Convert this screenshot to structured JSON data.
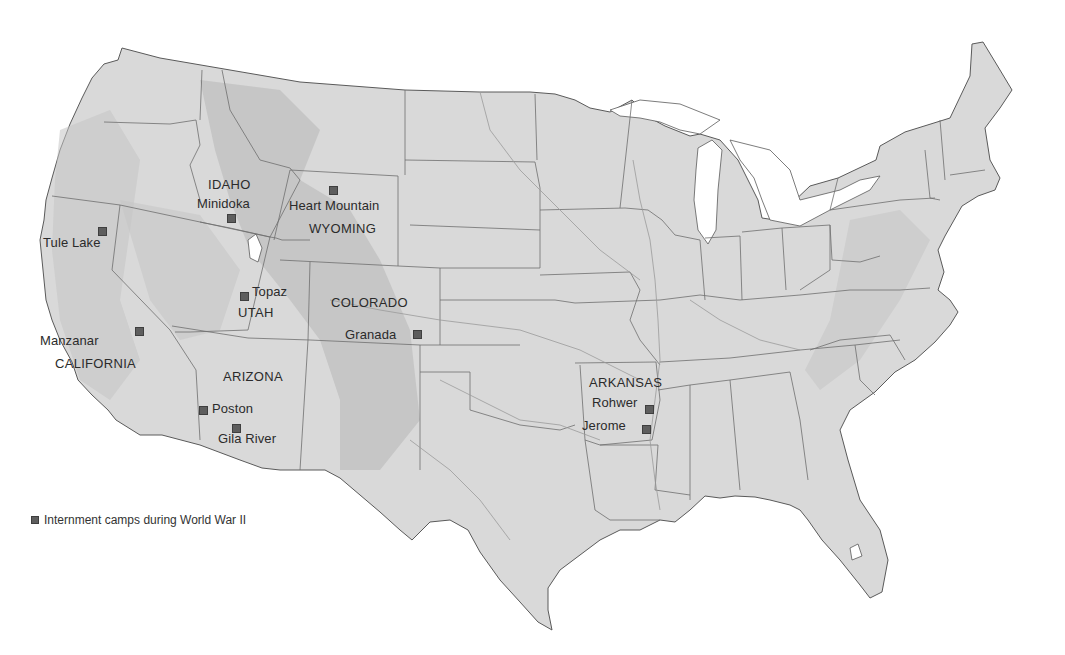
{
  "map": {
    "subject": "Japanese American internment camps, contiguous United States",
    "colors": {
      "land": "#d9d9d9",
      "relief": "#c4c4c4",
      "border": "#5a5a5a",
      "water": "#ffffff",
      "marker": "#5e5e5e",
      "text": "#2b2b2b"
    }
  },
  "states": [
    {
      "name": "IDAHO",
      "x": 208,
      "y": 178
    },
    {
      "name": "WYOMING",
      "x": 309,
      "y": 222
    },
    {
      "name": "UTAH",
      "x": 238,
      "y": 306
    },
    {
      "name": "COLORADO",
      "x": 331,
      "y": 296
    },
    {
      "name": "CALIFORNIA",
      "x": 55,
      "y": 357
    },
    {
      "name": "ARIZONA",
      "x": 223,
      "y": 370
    },
    {
      "name": "ARKANSAS",
      "x": 589,
      "y": 376
    }
  ],
  "camps": [
    {
      "name": "Tule Lake",
      "label_x": 43,
      "label_y": 236,
      "marker_x": 98,
      "marker_y": 227
    },
    {
      "name": "Minidoka",
      "label_x": 197,
      "label_y": 197,
      "marker_x": 227,
      "marker_y": 214
    },
    {
      "name": "Heart Mountain",
      "label_x": 289,
      "label_y": 199,
      "marker_x": 329,
      "marker_y": 186
    },
    {
      "name": "Topaz",
      "label_x": 252,
      "label_y": 285,
      "marker_x": 240,
      "marker_y": 292
    },
    {
      "name": "Granada",
      "label_x": 345,
      "label_y": 328,
      "marker_x": 413,
      "marker_y": 330
    },
    {
      "name": "Manzanar",
      "label_x": 40,
      "label_y": 334,
      "marker_x": 135,
      "marker_y": 327
    },
    {
      "name": "Poston",
      "label_x": 212,
      "label_y": 402,
      "marker_x": 199,
      "marker_y": 406
    },
    {
      "name": "Gila River",
      "label_x": 218,
      "label_y": 432,
      "marker_x": 232,
      "marker_y": 424
    },
    {
      "name": "Rohwer",
      "label_x": 592,
      "label_y": 396,
      "marker_x": 645,
      "marker_y": 405
    },
    {
      "name": "Jerome",
      "label_x": 582,
      "label_y": 419,
      "marker_x": 642,
      "marker_y": 425
    }
  ],
  "legend": {
    "label": "Internment camps during World War II",
    "icon": "square-marker-icon"
  }
}
